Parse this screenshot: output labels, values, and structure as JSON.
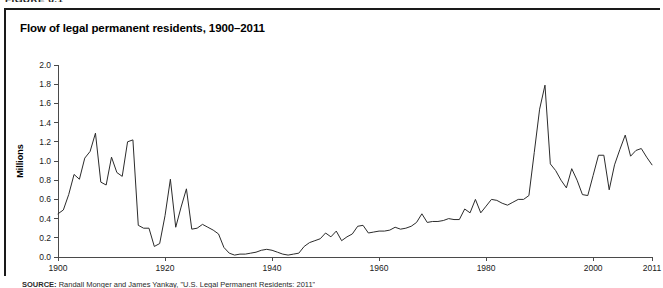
{
  "figure": {
    "number_label": "FIGURE 6.1"
  },
  "panel": {
    "title": "Flow of legal permanent residents, 1900–2011"
  },
  "source": {
    "prefix": "SOURCE:",
    "text": "Randall Monger and James Yankay, \"U.S. Legal Permanent Residents: 2011\""
  },
  "axes": {
    "y_title": "Millions",
    "y_ticks": [
      "0.0",
      "0.2",
      "0.4",
      "0.6",
      "0.8",
      "1.0",
      "1.2",
      "1.4",
      "1.6",
      "1.8",
      "2.0"
    ],
    "x_ticks": [
      "1900",
      "1920",
      "1940",
      "1960",
      "1980",
      "2000",
      "2011"
    ]
  },
  "colors": {
    "line": "#2b2b2b",
    "axis": "#4a4a4a",
    "frame": "#1a1a1a",
    "background": "#ffffff"
  },
  "chart_data": {
    "type": "line",
    "title": "Flow of legal permanent residents, 1900–2011",
    "xlabel": "",
    "ylabel": "Millions",
    "xlim": [
      1900,
      2011
    ],
    "ylim": [
      0.0,
      2.0
    ],
    "ytick_step": 0.2,
    "xtick_values": [
      1900,
      1920,
      1940,
      1960,
      1980,
      2000,
      2011
    ],
    "grid": false,
    "legend": "none",
    "units": "millions of persons",
    "series": [
      {
        "name": "Legal permanent residents",
        "x": [
          1900,
          1901,
          1902,
          1903,
          1904,
          1905,
          1906,
          1907,
          1908,
          1909,
          1910,
          1911,
          1912,
          1913,
          1914,
          1915,
          1916,
          1917,
          1918,
          1919,
          1920,
          1921,
          1922,
          1923,
          1924,
          1925,
          1926,
          1927,
          1928,
          1929,
          1930,
          1931,
          1932,
          1933,
          1934,
          1935,
          1936,
          1937,
          1938,
          1939,
          1940,
          1941,
          1942,
          1943,
          1944,
          1945,
          1946,
          1947,
          1948,
          1949,
          1950,
          1951,
          1952,
          1953,
          1954,
          1955,
          1956,
          1957,
          1958,
          1959,
          1960,
          1961,
          1962,
          1963,
          1964,
          1965,
          1966,
          1967,
          1968,
          1969,
          1970,
          1971,
          1972,
          1973,
          1974,
          1975,
          1976,
          1977,
          1978,
          1979,
          1980,
          1981,
          1982,
          1983,
          1984,
          1985,
          1986,
          1987,
          1988,
          1989,
          1990,
          1991,
          1992,
          1993,
          1994,
          1995,
          1996,
          1997,
          1998,
          1999,
          2000,
          2001,
          2002,
          2003,
          2004,
          2005,
          2006,
          2007,
          2008,
          2009,
          2010,
          2011
        ],
        "values": [
          0.45,
          0.49,
          0.65,
          0.86,
          0.81,
          1.03,
          1.1,
          1.29,
          0.78,
          0.75,
          1.04,
          0.88,
          0.84,
          1.2,
          1.22,
          0.33,
          0.3,
          0.3,
          0.11,
          0.14,
          0.43,
          0.81,
          0.31,
          0.52,
          0.71,
          0.29,
          0.3,
          0.34,
          0.31,
          0.28,
          0.24,
          0.1,
          0.04,
          0.02,
          0.03,
          0.03,
          0.04,
          0.05,
          0.07,
          0.08,
          0.07,
          0.05,
          0.03,
          0.02,
          0.03,
          0.04,
          0.11,
          0.15,
          0.17,
          0.19,
          0.25,
          0.21,
          0.27,
          0.17,
          0.21,
          0.24,
          0.32,
          0.33,
          0.25,
          0.26,
          0.27,
          0.27,
          0.28,
          0.31,
          0.29,
          0.3,
          0.32,
          0.36,
          0.45,
          0.36,
          0.37,
          0.37,
          0.38,
          0.4,
          0.39,
          0.39,
          0.5,
          0.46,
          0.6,
          0.46,
          0.53,
          0.6,
          0.59,
          0.56,
          0.54,
          0.57,
          0.6,
          0.6,
          0.64,
          1.09,
          1.54,
          1.79,
          0.97,
          0.9,
          0.8,
          0.72,
          0.92,
          0.8,
          0.65,
          0.64,
          0.85,
          1.06,
          1.06,
          0.7,
          0.96,
          1.12,
          1.27,
          1.05,
          1.11,
          1.13,
          1.04,
          0.96
        ]
      }
    ],
    "annotations": [
      {
        "label": "pre-WWI peak",
        "x": 1907,
        "y": 1.29
      },
      {
        "label": "WWI collapse",
        "x": 1918,
        "y": 0.11
      },
      {
        "label": "Depression/WWII trough",
        "x": 1933,
        "y": 0.02
      },
      {
        "label": "IRCA legalization peak",
        "x": 1991,
        "y": 1.79
      }
    ]
  }
}
